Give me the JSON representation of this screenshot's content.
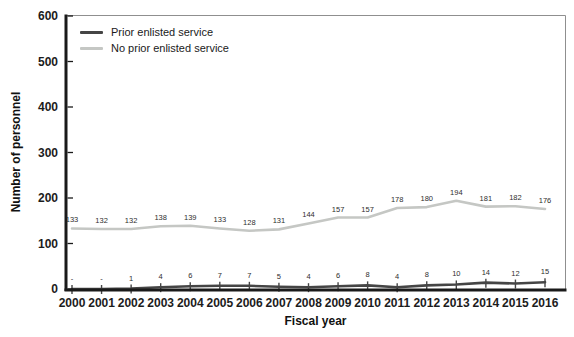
{
  "figure": {
    "ylabel": "Number of personnel",
    "xlabel": "Fiscal year"
  },
  "legend": {
    "items": [
      {
        "label": "Prior enlisted service",
        "color": "#454545"
      },
      {
        "label": "No prior enlisted service",
        "color": "#c5c7c4"
      }
    ]
  },
  "chart_data": {
    "type": "line",
    "title": "",
    "xlabel": "Fiscal year",
    "ylabel": "Number of personnel",
    "x": [
      2000,
      2001,
      2002,
      2003,
      2004,
      2005,
      2006,
      2007,
      2008,
      2009,
      2010,
      2011,
      2012,
      2013,
      2014,
      2015,
      2016
    ],
    "ylim": [
      0,
      600
    ],
    "yticks": [
      0,
      100,
      200,
      300,
      400,
      500,
      600
    ],
    "grid": false,
    "legend_position": "top-left",
    "axis_color": "#1a1a1a",
    "border_color": "#8f8f8f",
    "series": [
      {
        "name": "Prior enlisted service",
        "color": "#454545",
        "marker": "vertical-tick",
        "values": [
          0,
          0,
          1,
          4,
          6,
          7,
          7,
          5,
          4,
          6,
          8,
          4,
          8,
          10,
          14,
          12,
          15
        ],
        "labels": [
          "-",
          "-",
          "1",
          "4",
          "6",
          "7",
          "7",
          "5",
          "4",
          "6",
          "8",
          "4",
          "8",
          "10",
          "14",
          "12",
          "15"
        ]
      },
      {
        "name": "No prior enlisted service",
        "color": "#c5c7c4",
        "marker": "none",
        "values": [
          133,
          132,
          132,
          138,
          139,
          133,
          128,
          131,
          144,
          157,
          157,
          178,
          180,
          194,
          181,
          182,
          176
        ],
        "labels": [
          "133",
          "132",
          "132",
          "138",
          "139",
          "133",
          "128",
          "131",
          "144",
          "157",
          "157",
          "178",
          "180",
          "194",
          "181",
          "182",
          "176"
        ]
      }
    ]
  }
}
